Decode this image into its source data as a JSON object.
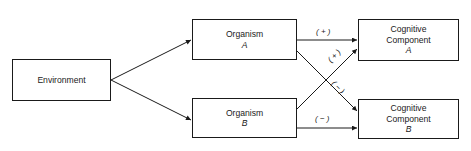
{
  "diagram": {
    "nodes": {
      "environment": {
        "label": "Environment"
      },
      "organism_a": {
        "label": "Organism",
        "sub": "A"
      },
      "organism_b": {
        "label": "Organism",
        "sub": "B"
      },
      "cognitive_a": {
        "line1": "Cognitive",
        "line2": "Component",
        "sub": "A"
      },
      "cognitive_b": {
        "line1": "Cognitive",
        "line2": "Component",
        "sub": "B"
      }
    },
    "edges": [
      {
        "from": "Environment",
        "to": "Organism A",
        "label": ""
      },
      {
        "from": "Environment",
        "to": "Organism B",
        "label": ""
      },
      {
        "from": "Organism A",
        "to": "Cognitive Component A",
        "label": "(+)"
      },
      {
        "from": "Organism B",
        "to": "Cognitive Component A",
        "label": "(+)"
      },
      {
        "from": "Organism A",
        "to": "Cognitive Component B",
        "label": "(−)"
      },
      {
        "from": "Organism B",
        "to": "Cognitive Component B",
        "label": "(−)"
      }
    ],
    "edge_labels": {
      "oa_ca": "( + )",
      "ob_ca": "( + )",
      "oa_cb": "( − )",
      "ob_cb": "( − )"
    },
    "colors": {
      "stroke": "#1a1a1a",
      "background": "#ffffff"
    }
  }
}
